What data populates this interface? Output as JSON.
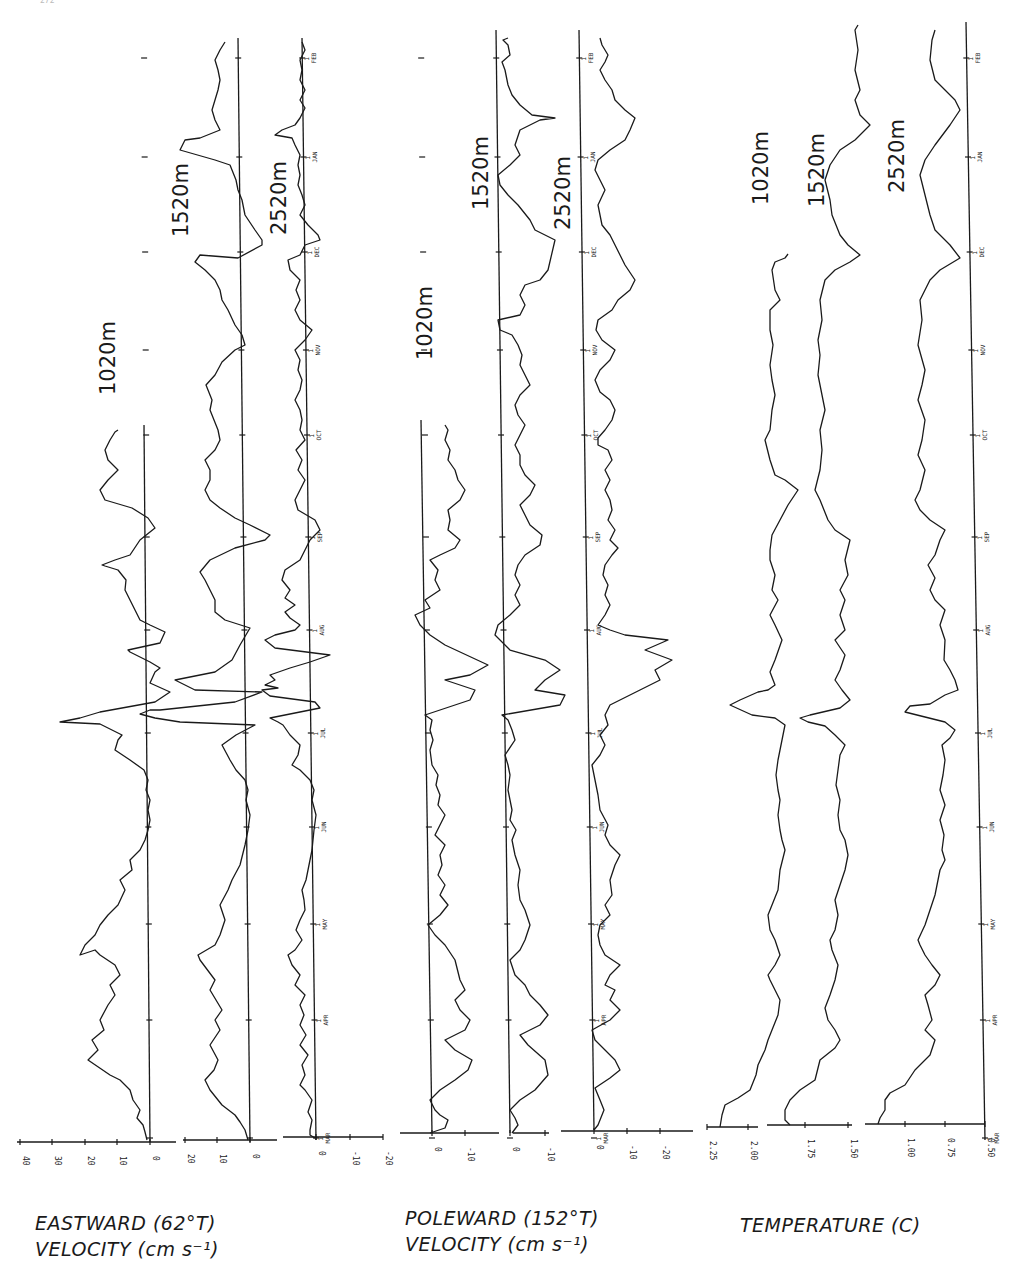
{
  "page": {
    "number": "272"
  },
  "titles": {
    "eastward_line1": "EASTWARD (62°T)",
    "eastward_line2": "VELOCITY (cm s⁻¹)",
    "poleward_line1": "POLEWARD (152°T)",
    "poleward_line2": "VELOCITY (cm s⁻¹)",
    "temperature_line1": "TEMPERATURE (C)"
  },
  "chart_data": [
    {
      "type": "line",
      "title": "EASTWARD (62°T) VELOCITY (cm s-1)",
      "orientation": "time axis vertical (MAR bottom to FEB top), value axis horizontal",
      "xlabel": "Time (1 MAR – 1 FEB)",
      "ylabel": "Eastward velocity (cm s-1)",
      "time_ticks": [
        "1 MAR",
        "1 APR",
        "1 MAY",
        "1 JUN",
        "1 JUL",
        "1 AUG",
        "1 SEP",
        "1 OCT",
        "1 NOV",
        "1 DEC",
        "1 JAN",
        "1 FEB"
      ],
      "series": [
        {
          "name": "1020m",
          "value_ticks": [
            40,
            30,
            20,
            10,
            0
          ],
          "range": [
            -5,
            45
          ],
          "x": [
            "MAR",
            "MAR15",
            "APR",
            "APR15",
            "MAY",
            "MAY15",
            "JUN",
            "JUN15",
            "JUL",
            "JUL10",
            "JUL20",
            "AUG",
            "AUG15",
            "SEP",
            "SEP15",
            "OCT",
            "OCT15"
          ],
          "values": [
            1,
            8,
            17,
            14,
            20,
            12,
            1,
            0,
            -1,
            18,
            44,
            -10,
            22,
            -12,
            12,
            16,
            12
          ]
        },
        {
          "name": "1520m",
          "value_ticks": [
            20,
            10,
            0
          ],
          "range": [
            -20,
            25
          ],
          "x": [
            "MAR",
            "MAR15",
            "APR",
            "APR15",
            "MAY",
            "MAY15",
            "JUN",
            "JUN15",
            "JUL",
            "JUL10",
            "JUL20",
            "AUG",
            "AUG15",
            "SEP",
            "SEP15",
            "OCT",
            "NOV",
            "NOV15",
            "DEC",
            "DEC10",
            "JAN",
            "JAN15",
            "FEB"
          ],
          "values": [
            1,
            10,
            14,
            12,
            14,
            8,
            1,
            0,
            -1,
            15,
            -8,
            -10,
            12,
            -15,
            10,
            12,
            7,
            -14,
            14,
            -5,
            3,
            25,
            5
          ]
        },
        {
          "name": "2520m",
          "value_ticks": [
            0,
            -10,
            -20
          ],
          "range": [
            -25,
            10
          ],
          "x": [
            "MAR",
            "MAR15",
            "APR",
            "APR15",
            "MAY",
            "MAY15",
            "JUN",
            "JUN15",
            "JUL",
            "JUL20",
            "AUG",
            "AUG10",
            "SEP",
            "SEP15",
            "OCT",
            "NOV",
            "NOV15",
            "DEC",
            "DEC10",
            "JAN",
            "JAN15",
            "FEB"
          ],
          "values": [
            2,
            6,
            6,
            4,
            6,
            4,
            1,
            0,
            1,
            10,
            -25,
            10,
            5,
            10,
            5,
            6,
            -12,
            5,
            -8,
            3,
            10,
            4
          ]
        }
      ]
    },
    {
      "type": "line",
      "title": "POLEWARD (152°T) VELOCITY (cm s-1)",
      "xlabel": "Time (1 MAR – 1 FEB)",
      "ylabel": "Poleward velocity (cm s-1)",
      "time_ticks": [
        "1 MAR",
        "1 APR",
        "1 MAY",
        "1 JUN",
        "1 JUL",
        "1 AUG",
        "1 SEP",
        "1 OCT",
        "1 NOV",
        "1 DEC",
        "1 JAN",
        "1 FEB"
      ],
      "series": [
        {
          "name": "1020m",
          "value_ticks": [
            0,
            -10
          ],
          "range": [
            -15,
            8
          ],
          "x": [
            "MAR",
            "MAR15",
            "APR",
            "APR15",
            "MAY",
            "MAY15",
            "JUN",
            "JUN15",
            "JUL",
            "JUL15",
            "JUL25",
            "AUG",
            "AUG15",
            "SEP",
            "SEP15",
            "OCT",
            "OCT15"
          ],
          "values": [
            -3,
            -10,
            -8,
            -12,
            -2,
            -5,
            -4,
            -2,
            0,
            -16,
            -12,
            5,
            -10,
            -8,
            -12,
            -10,
            -6
          ]
        },
        {
          "name": "1520m",
          "value_ticks": [
            0,
            -10
          ],
          "range": [
            -15,
            8
          ],
          "x": [
            "MAR",
            "MAR15",
            "APR",
            "APR15",
            "MAY",
            "MAY15",
            "JUN",
            "JUN15",
            "JUL",
            "JUL15",
            "JUL25",
            "AUG",
            "AUG15",
            "SEP",
            "SEP15",
            "OCT",
            "NOV",
            "NOV15",
            "DEC",
            "DEC15",
            "JAN",
            "JAN15",
            "FEB"
          ],
          "values": [
            -2,
            -10,
            -8,
            -12,
            0,
            -5,
            -4,
            -2,
            0,
            -15,
            -12,
            3,
            -10,
            -8,
            -12,
            -10,
            1,
            -7,
            -10,
            -12,
            1,
            -14,
            -5
          ]
        },
        {
          "name": "2520m",
          "value_ticks": [
            0,
            -10,
            -20
          ],
          "range": [
            -25,
            5
          ],
          "x": [
            "MAR",
            "MAR15",
            "APR",
            "APR15",
            "MAY",
            "MAY15",
            "JUN",
            "JUN15",
            "JUL",
            "JUL15",
            "JUL25",
            "AUG",
            "AUG15",
            "SEP",
            "OCT",
            "NOV",
            "NOV15",
            "DEC",
            "DEC15",
            "JAN",
            "JAN15",
            "FEB"
          ],
          "values": [
            -2,
            -6,
            -1,
            -8,
            0,
            -5,
            -6,
            -4,
            1,
            -4,
            -22,
            -5,
            -8,
            -10,
            -6,
            1,
            -8,
            -8,
            -12,
            0,
            -12,
            -4
          ]
        }
      ]
    },
    {
      "type": "line",
      "title": "TEMPERATURE (C)",
      "xlabel": "Time (1 MAR – 1 FEB)",
      "ylabel": "Temperature (C)",
      "time_ticks": [
        "1 MAR",
        "1 APR",
        "1 MAY",
        "1 JUN",
        "1 JUL",
        "1 AUG",
        "1 SEP",
        "1 OCT",
        "1 NOV",
        "1 DEC",
        "1 JAN",
        "1 FEB"
      ],
      "series": [
        {
          "name": "1020m",
          "value_ticks": [
            2.25,
            2.0
          ],
          "range": [
            1.8,
            2.35
          ],
          "x": [
            "MAR",
            "MAR15",
            "APR",
            "APR15",
            "MAY",
            "MAY15",
            "JUN",
            "JUN15",
            "JUL",
            "JUL15",
            "JUL20",
            "AUG",
            "AUG15",
            "SEP",
            "SEP15",
            "OCT",
            "OCT15",
            "NOV",
            "NOV15",
            "DEC"
          ],
          "values": [
            2.05,
            2.14,
            2.08,
            2.15,
            2.12,
            2.15,
            2.12,
            2.12,
            2.08,
            2.18,
            2.22,
            2.12,
            2.1,
            1.95,
            2.1,
            2.15,
            2.12,
            2.15,
            2.16,
            2.1
          ]
        },
        {
          "name": "1520m",
          "value_ticks": [
            1.75,
            1.5
          ],
          "range": [
            1.35,
            1.85
          ],
          "x": [
            "MAR",
            "MAR15",
            "APR",
            "APR15",
            "MAY",
            "MAY15",
            "JUN",
            "JUN15",
            "JUL",
            "JUL15",
            "JUL20",
            "AUG",
            "AUG15",
            "SEP",
            "SEP15",
            "OCT",
            "NOV",
            "DEC",
            "DEC15",
            "JAN",
            "JAN15",
            "FEB"
          ],
          "values": [
            1.72,
            1.66,
            1.58,
            1.65,
            1.62,
            1.63,
            1.62,
            1.6,
            1.55,
            1.68,
            1.72,
            1.6,
            1.62,
            1.47,
            1.62,
            1.64,
            1.65,
            1.45,
            1.6,
            1.65,
            1.5,
            1.58
          ]
        },
        {
          "name": "2520m",
          "value_ticks": [
            1.0,
            0.75,
            0.5
          ],
          "range": [
            0.45,
            1.25
          ],
          "x": [
            "MAR",
            "MAR15",
            "APR",
            "APR15",
            "MAY",
            "MAY15",
            "JUN",
            "JUN15",
            "JUL",
            "JUL15",
            "JUL20",
            "AUG",
            "AUG15",
            "SEP",
            "SEP15",
            "OCT",
            "NOV",
            "DEC",
            "DEC15",
            "JAN",
            "JAN15",
            "FEB"
          ],
          "values": [
            1.05,
            0.92,
            0.8,
            0.9,
            0.85,
            0.88,
            0.85,
            0.82,
            0.72,
            0.95,
            1.08,
            0.62,
            0.85,
            0.62,
            0.85,
            0.9,
            0.88,
            0.62,
            0.9,
            0.92,
            0.7,
            0.88
          ]
        }
      ]
    }
  ],
  "axes": {
    "eastward_1020_ticks": [
      "40",
      "30",
      "20",
      "10",
      "0"
    ],
    "eastward_1520_ticks": [
      "20",
      "10",
      "0"
    ],
    "eastward_2520_ticks": [
      "0",
      "-10",
      "-20"
    ],
    "poleward_1020_ticks": [
      "0",
      "-10"
    ],
    "poleward_1520_ticks": [
      "0",
      "-10"
    ],
    "poleward_2520_ticks": [
      "0",
      "-10",
      "-20"
    ],
    "temp_1020_ticks": [
      "2.25",
      "2.00"
    ],
    "temp_1520_ticks": [
      "1.75",
      "1.50"
    ],
    "temp_2520_ticks": [
      "1.00",
      "0.75",
      "0.50"
    ],
    "month_labels": [
      "MAR",
      "APR",
      "MAY",
      "JUN",
      "JUL",
      "AUG",
      "SEP",
      "OCT",
      "NOV",
      "DEC",
      "JAN",
      "FEB"
    ],
    "month_day": "1"
  },
  "depth_labels": {
    "east_1020": "1020m",
    "east_1520": "1520m",
    "east_2520": "2520m",
    "pole_1020": "1020m",
    "pole_1520": "1520m",
    "pole_2520": "2520m",
    "temp_1020": "1020m",
    "temp_1520": "1520m",
    "temp_2520": "2520m"
  }
}
